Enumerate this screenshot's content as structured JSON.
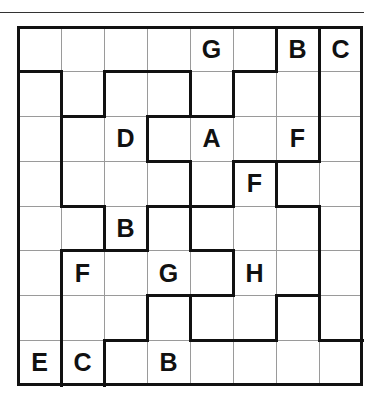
{
  "puzzle": {
    "rows": 8,
    "cols": 8,
    "cells": [
      [
        "",
        "",
        "",
        "",
        "G",
        "",
        "B",
        "C"
      ],
      [
        "",
        "",
        "",
        "",
        "",
        "",
        "",
        ""
      ],
      [
        "",
        "",
        "D",
        "",
        "A",
        "",
        "F",
        ""
      ],
      [
        "",
        "",
        "",
        "",
        "",
        "F",
        "",
        ""
      ],
      [
        "",
        "",
        "B",
        "",
        "",
        "",
        "",
        ""
      ],
      [
        "",
        "F",
        "",
        "G",
        "",
        "H",
        "",
        ""
      ],
      [
        "",
        "",
        "",
        "",
        "",
        "",
        "",
        ""
      ],
      [
        "E",
        "C",
        "",
        "B",
        "",
        "",
        "",
        ""
      ]
    ],
    "thick_horizontal": {
      "1": [
        0,
        2,
        3,
        5
      ],
      "2": [
        1,
        3,
        4
      ],
      "3": [
        3,
        5,
        6
      ],
      "4": [
        1,
        3,
        4,
        6
      ],
      "5": [
        1,
        2,
        4
      ],
      "6": [
        3,
        4,
        6
      ],
      "7": [
        2,
        4,
        5,
        7
      ]
    },
    "thick_vertical": {
      "0": [
        6,
        7
      ],
      "1": [
        1,
        2,
        4,
        5,
        7
      ],
      "2": [
        1,
        3,
        7
      ],
      "3": [
        1,
        4,
        5,
        6
      ],
      "4": [
        2,
        3,
        4,
        7
      ],
      "5": [
        1,
        5,
        7
      ],
      "6": [
        1,
        3,
        4,
        6,
        7
      ],
      "7": [
        1,
        2
      ]
    }
  }
}
